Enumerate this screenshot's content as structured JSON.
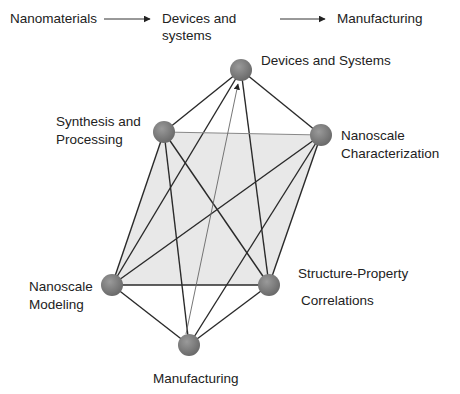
{
  "header_flow": {
    "step1": "Nanomaterials",
    "step2_line1": "Devices and",
    "step2_line2": "systems",
    "step3": "Manufacturing"
  },
  "nodes": [
    {
      "id": "devices",
      "label": "Devices and Systems",
      "x": 241,
      "y": 70
    },
    {
      "id": "synthesis",
      "label": "Synthesis and\nProcessing",
      "x": 164,
      "y": 132
    },
    {
      "id": "characterization",
      "label": "Nanoscale\nCharacterization",
      "x": 321,
      "y": 135
    },
    {
      "id": "modeling",
      "label": "Nanoscale\nModeling",
      "x": 112,
      "y": 285
    },
    {
      "id": "structure",
      "label": "Structure-Property\nCorrelations",
      "x": 269,
      "y": 285
    },
    {
      "id": "manufacturing",
      "label": "Manufacturing",
      "x": 189,
      "y": 345
    }
  ],
  "labels": {
    "devices": "Devices and Systems",
    "synthesis_1": "Synthesis and",
    "synthesis_2": "Processing",
    "characterization_1": "Nanoscale",
    "characterization_2": "Characterization",
    "modeling_1": "Nanoscale",
    "modeling_2": "Modeling",
    "structure_1": "Structure-Property",
    "structure_2": "Correlations",
    "manufacturing": "Manufacturing"
  },
  "colors": {
    "node_fill": "#7d7d7d",
    "edge": "#2a2a2a",
    "plane_fill": "#e6e6e6"
  }
}
